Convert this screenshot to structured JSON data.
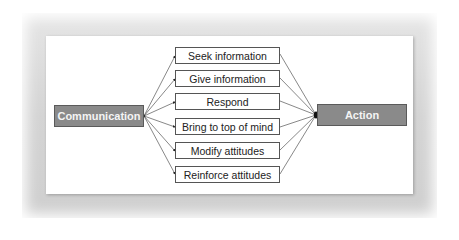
{
  "diagram": {
    "source": {
      "label": "Communication"
    },
    "target": {
      "label": "Action"
    },
    "intermediates": [
      {
        "label": "Seek information"
      },
      {
        "label": "Give information"
      },
      {
        "label": "Respond"
      },
      {
        "label": "Bring to top of mind"
      },
      {
        "label": "Modify attitudes"
      },
      {
        "label": "Reinforce attitudes"
      }
    ],
    "colors": {
      "main_box_fill": "#8a8a8a",
      "main_box_text": "#f4f4f4",
      "mid_box_border": "#555555",
      "connector": "#444444",
      "frame": "#d4d4d4"
    }
  }
}
